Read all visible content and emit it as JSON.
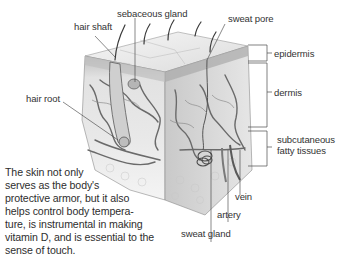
{
  "labels": {
    "hair_shaft": "hair shaft",
    "sebaceous_gland": "sebaceous gland",
    "sweat_pore": "sweat pore",
    "epidermis": "epidermis",
    "dermis": "dermis",
    "hair_root": "hair root",
    "subcutaneous_line1": "subcutaneous",
    "subcutaneous_line2": "fatty tissues",
    "vein": "vein",
    "artery": "artery",
    "sweat_gland": "sweat gland"
  },
  "caption": {
    "lines": [
      "The skin not only",
      "serves as the body's",
      "protective armor, but it also",
      "helps control body tempera-",
      "ture, is instrumental in making",
      "vitamin D, and is essential to the",
      "sense of touch."
    ]
  },
  "colors": {
    "epidermis_top": "#ececec",
    "dermis": "#d6d6d6",
    "fat": "#f1f1f1",
    "vessel": "#6a6a6a",
    "leader": "#3a3a3a"
  }
}
